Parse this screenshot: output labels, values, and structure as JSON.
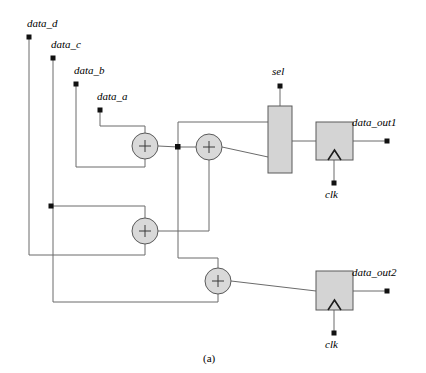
{
  "figure": {
    "caption": "(a)",
    "background_color": "#ffffff",
    "wire_color": "#6b6b6b",
    "block_fill": "#d4d4d4",
    "adder_fill": "#d9d9d9",
    "terminal_color": "#111111"
  },
  "inputs": [
    {
      "label": "data_d",
      "terminal_x": 29,
      "terminal_y": 37,
      "label_x": 27,
      "label_y": 18
    },
    {
      "label": "data_c",
      "terminal_x": 53,
      "terminal_y": 58,
      "label_x": 51,
      "label_y": 39
    },
    {
      "label": "data_b",
      "terminal_x": 76,
      "terminal_y": 84,
      "label_x": 74,
      "label_y": 65
    },
    {
      "label": "data_a",
      "terminal_x": 100,
      "terminal_y": 110,
      "label_x": 97,
      "label_y": 91
    }
  ],
  "control": {
    "sel": {
      "label": "sel",
      "terminal_x": 280,
      "terminal_y": 86,
      "label_x": 273,
      "label_y": 67
    }
  },
  "clocks": [
    {
      "label": "clk",
      "terminal_x": 334,
      "terminal_y": 183,
      "label_x": 326,
      "label_y": 190
    },
    {
      "label": "clk",
      "terminal_x": 334,
      "terminal_y": 333,
      "label_x": 326,
      "label_y": 340
    }
  ],
  "outputs": [
    {
      "label": "data_out1",
      "terminal_x": 387,
      "terminal_y": 141,
      "label_x": 352,
      "label_y": 119
    },
    {
      "label": "data_out2",
      "terminal_x": 387,
      "terminal_y": 291,
      "label_x": 352,
      "label_y": 269
    }
  ],
  "adders": [
    {
      "name": "adder-1",
      "symbol": "+",
      "cx": 145,
      "cy": 146,
      "r": 13
    },
    {
      "name": "adder-2",
      "symbol": "+",
      "cx": 209,
      "cy": 147,
      "r": 13
    },
    {
      "name": "adder-3",
      "symbol": "+",
      "cx": 145,
      "cy": 231,
      "r": 13
    },
    {
      "name": "adder-4",
      "symbol": "+",
      "cx": 218,
      "cy": 281,
      "r": 13
    }
  ],
  "blocks": [
    {
      "name": "mux",
      "x": 268,
      "y": 106,
      "w": 24,
      "h": 67,
      "kind": "multiplexer"
    },
    {
      "name": "register-1",
      "x": 316,
      "y": 122,
      "w": 37,
      "h": 38,
      "kind": "register"
    },
    {
      "name": "register-2",
      "x": 316,
      "y": 271,
      "w": 37,
      "h": 39,
      "kind": "register"
    }
  ],
  "junctions": [
    {
      "name": "junction-adder1-out",
      "x": 178,
      "y": 147
    },
    {
      "name": "junction-data-c-branch",
      "x": 51,
      "y": 206
    }
  ]
}
